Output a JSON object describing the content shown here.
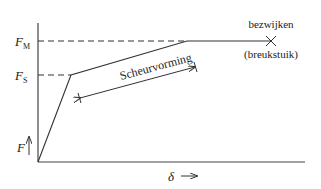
{
  "diagram": {
    "type": "force-displacement",
    "y_axis": {
      "label": "F",
      "arrow": "up"
    },
    "x_axis": {
      "label": "δ",
      "arrow": "→"
    },
    "levels": [
      {
        "symbol": "F",
        "subscript": "M"
      },
      {
        "symbol": "F",
        "subscript": "S"
      }
    ],
    "annotations": {
      "crack_region": "Scheurvorming",
      "failure": "bezwijken",
      "failure_sub": "(breukstuik)"
    },
    "colors": {
      "line": "#333333",
      "text": "#222222",
      "background": "#ffffff"
    }
  }
}
